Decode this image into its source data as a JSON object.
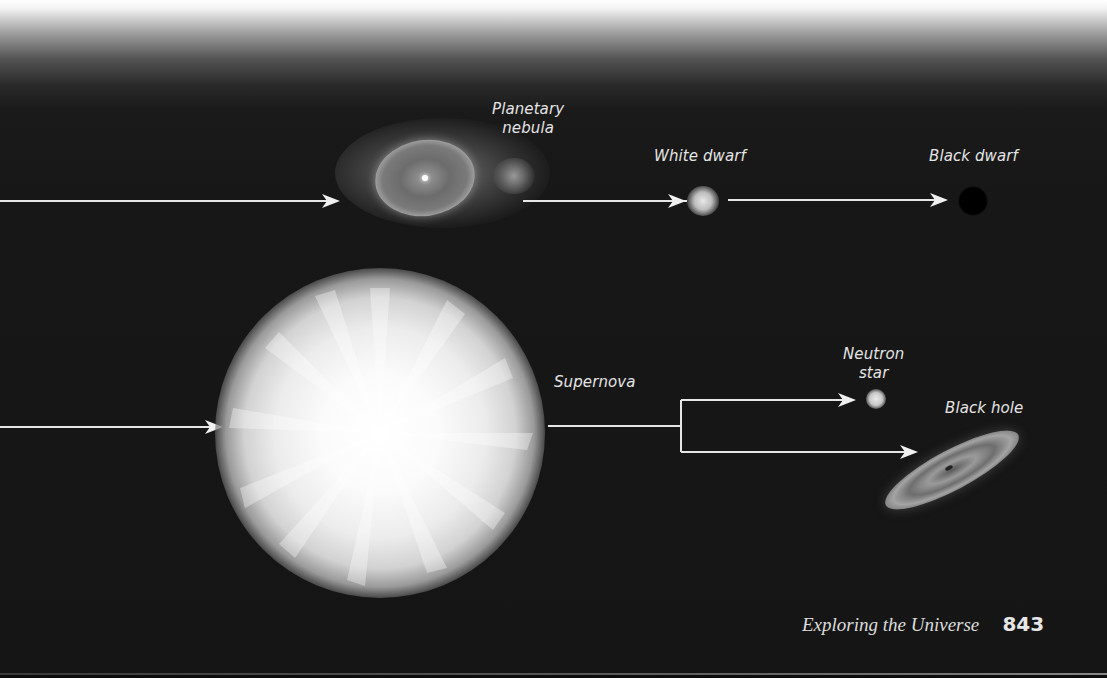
{
  "figure": {
    "type": "stellar evolution diagram (massive star paths)",
    "upper_path": {
      "stages": [
        {
          "label_line1": "Planetary",
          "label_line2": "nebula"
        },
        {
          "label": "White dwarf"
        },
        {
          "label": "Black dwarf"
        }
      ]
    },
    "lower_path": {
      "stages": [
        {
          "label": "Supernova"
        },
        {
          "label_line1": "Neutron",
          "label_line2": "star"
        },
        {
          "label": "Black hole"
        }
      ]
    },
    "colors": {
      "background": "#151515",
      "arrow": "#e8e8e8",
      "label_text": "#e4e4e4",
      "top_fade": "#ffffff"
    }
  },
  "footer": {
    "running_title": "Exploring the Universe",
    "page_number": "843"
  }
}
